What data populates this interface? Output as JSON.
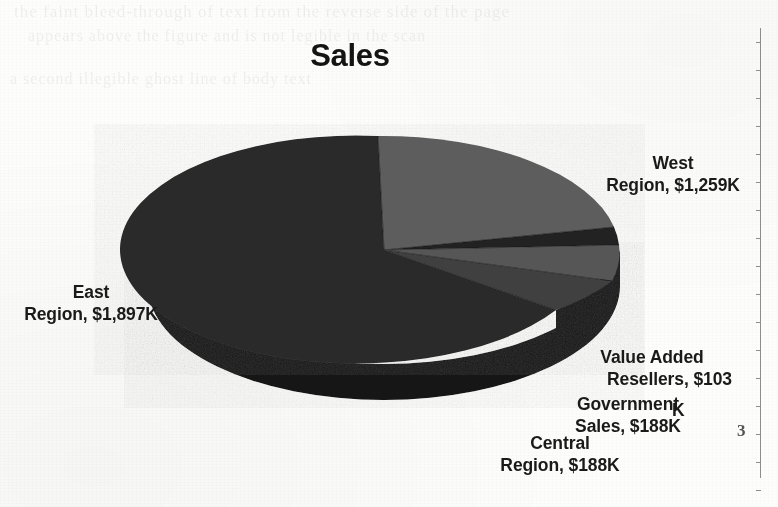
{
  "page": {
    "background_color": "#fdfdfc",
    "page_number": "3",
    "ghost_text": [
      "the faint bleed-through of text from the reverse side of the page",
      "appears above the figure and is not legible in the scan",
      "a second illegible ghost line of body text"
    ]
  },
  "chart_data": {
    "type": "pie",
    "title": "Sales",
    "xlabel": "",
    "ylabel": "",
    "legend_position": "none",
    "grid": false,
    "three_d": true,
    "value_unit": "$K",
    "categories": [
      "West Region",
      "Value Added Resellers",
      "Government Sales",
      "Central Region",
      "East Region"
    ],
    "values": [
      1259,
      103,
      188,
      188,
      1897
    ],
    "labels": [
      {
        "name": "West Region",
        "line1": "West",
        "line2": "Region, $1,259K",
        "value": 1259,
        "value_text": "$1,259K",
        "color": "#5d5d5d"
      },
      {
        "name": "Value Added Resellers",
        "line1": "Value Added",
        "line2": "Resellers, $103",
        "line3": "K",
        "value": 103,
        "value_text": "$103K",
        "color": "#262626"
      },
      {
        "name": "Government Sales",
        "line1": "Government",
        "line2": "Sales, $188K",
        "value": 188,
        "value_text": "$188K",
        "color": "#565656"
      },
      {
        "name": "Central Region",
        "line1": "Central",
        "line2": "Region, $188K",
        "value": 188,
        "value_text": "$188K",
        "color": "#3f3f3f"
      },
      {
        "name": "East Region",
        "line1": "East",
        "line2": "Region, $1,897K",
        "value": 1897,
        "value_text": "$1,897K",
        "color": "#2b2b2b"
      }
    ],
    "colors": {
      "west_top": "#5d5d5d",
      "var_top": "#232323",
      "government_top": "#565656",
      "central_top": "#3f3f3f",
      "east_top": "#2b2b2b",
      "side_wall": "#121212",
      "title_color": "#141414",
      "label_color": "#1a1a1a"
    }
  }
}
